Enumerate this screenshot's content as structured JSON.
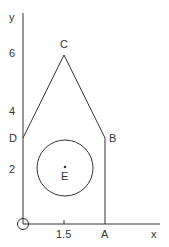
{
  "diagram": {
    "axes": {
      "x_label": "x",
      "y_label": "y",
      "x_ticks": [
        {
          "value": "1.5",
          "label": "1.5"
        }
      ],
      "y_ticks": [
        {
          "value": "2",
          "label": "2"
        },
        {
          "value": "4",
          "label": "4"
        },
        {
          "value": "6",
          "label": "6"
        }
      ],
      "origin_marker": "circle"
    },
    "points": {
      "A": {
        "label": "A",
        "coords": [
          3,
          0
        ]
      },
      "B": {
        "label": "B",
        "coords": [
          3,
          3
        ]
      },
      "C": {
        "label": "C",
        "coords": [
          1.5,
          6
        ]
      },
      "D": {
        "label": "D",
        "coords": [
          0,
          3
        ]
      },
      "E": {
        "label": "E",
        "coords": [
          1.5,
          1.8
        ]
      }
    },
    "shape": {
      "polygon": [
        "O",
        "A",
        "B",
        "C",
        "D"
      ],
      "circle_center": "E"
    },
    "colors": {
      "stroke": "#333333",
      "background": "#ffffff"
    }
  }
}
